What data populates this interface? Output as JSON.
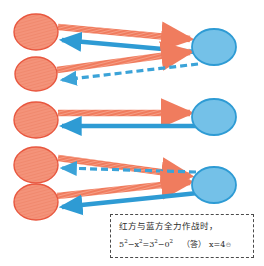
{
  "diagram": {
    "type": "tactical-engagement-diagram",
    "colors": {
      "red_fill": "#F4937A",
      "red_stroke": "#E8573F",
      "red_arrow": "#F07C5E",
      "blue_fill": "#74C1E8",
      "blue_stroke": "#2E9BD4",
      "blue_arrow": "#2E9BD4",
      "note_border": "#4a4a4a",
      "background": "#ffffff"
    },
    "groups": [
      {
        "id": "group-1",
        "red_units": [
          {
            "id": "red-unit-1",
            "cx": 36,
            "cy": 32,
            "rx": 22,
            "ry": 18
          },
          {
            "id": "red-unit-2",
            "cx": 36,
            "cy": 74,
            "rx": 21,
            "ry": 17
          }
        ],
        "blue_units": [
          {
            "id": "blue-unit-1",
            "cx": 214,
            "cy": 47,
            "rx": 22,
            "ry": 18
          }
        ],
        "arrows": [
          {
            "id": "red-attack-1",
            "side": "red",
            "style": "solid-hatched",
            "from": [
              58,
              27
            ],
            "to": [
              192,
              39
            ]
          },
          {
            "id": "blue-attack-1",
            "side": "blue",
            "style": "solid",
            "from": [
              194,
              52
            ],
            "to": [
              60,
              40
            ]
          },
          {
            "id": "red-attack-2",
            "side": "red",
            "style": "solid-hatched",
            "from": [
              57,
              70
            ],
            "to": [
              192,
              52
            ]
          },
          {
            "id": "blue-attack-2",
            "side": "blue",
            "style": "dashed",
            "from": [
              195,
              64
            ],
            "to": [
              60,
              80
            ]
          }
        ]
      },
      {
        "id": "group-2",
        "red_units": [
          {
            "id": "red-unit-3",
            "cx": 36,
            "cy": 120,
            "rx": 22,
            "ry": 18
          }
        ],
        "blue_units": [
          {
            "id": "blue-unit-2",
            "cx": 214,
            "cy": 117,
            "rx": 22,
            "ry": 18
          }
        ],
        "arrows": [
          {
            "id": "red-attack-3",
            "side": "red",
            "style": "solid-hatched",
            "from": [
              58,
              113
            ],
            "to": [
              192,
              113
            ]
          },
          {
            "id": "blue-attack-3",
            "side": "blue",
            "style": "solid",
            "from": [
              194,
              126
            ],
            "to": [
              60,
              126
            ]
          }
        ]
      },
      {
        "id": "group-3",
        "red_units": [
          {
            "id": "red-unit-4",
            "cx": 36,
            "cy": 165,
            "rx": 22,
            "ry": 18
          },
          {
            "id": "red-unit-5",
            "cx": 36,
            "cy": 202,
            "rx": 22,
            "ry": 18
          }
        ],
        "blue_units": [
          {
            "id": "blue-unit-3",
            "cx": 214,
            "cy": 185,
            "rx": 22,
            "ry": 18
          }
        ],
        "arrows": [
          {
            "id": "red-attack-4",
            "side": "red",
            "style": "solid-hatched",
            "from": [
              58,
              158
            ],
            "to": [
              192,
              176
            ]
          },
          {
            "id": "blue-attack-4",
            "side": "blue",
            "style": "dashed",
            "from": [
              194,
              172
            ],
            "to": [
              60,
              168
            ]
          },
          {
            "id": "red-attack-5",
            "side": "red",
            "style": "solid-hatched",
            "from": [
              57,
              196
            ],
            "to": [
              192,
              182
            ]
          },
          {
            "id": "blue-attack-5",
            "side": "blue",
            "style": "solid",
            "from": [
              196,
              193
            ],
            "to": [
              60,
              207
            ]
          }
        ]
      }
    ]
  },
  "note": {
    "line1": "红方与蓝方全力作战时，",
    "equation_lhs_base1": "5",
    "equation_lhs_exp1": "2",
    "equation_minus1": "−",
    "equation_lhs_base2": "x",
    "equation_lhs_exp2": "2",
    "equation_eq": "=",
    "equation_rhs_base1": "3",
    "equation_rhs_exp1": "2",
    "equation_minus2": "−",
    "equation_rhs_base2": "0",
    "equation_rhs_exp2": "2",
    "answer_label": "（答）",
    "answer_value": "x=4",
    "answer_tail": "⊖"
  }
}
